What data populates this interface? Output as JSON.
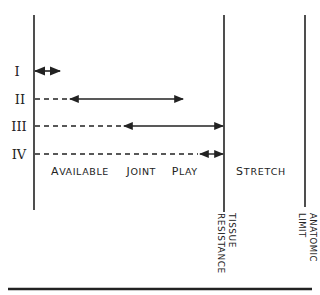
{
  "diagram": {
    "grades": [
      {
        "label": "I",
        "y": 71,
        "dash_end": 34,
        "arrow_start": 34,
        "arrow_end": 60
      },
      {
        "label": "II",
        "y": 99,
        "dash_end": 70,
        "arrow_start": 70,
        "arrow_end": 183
      },
      {
        "label": "III",
        "y": 126,
        "dash_end": 124,
        "arrow_start": 124,
        "arrow_end": 223
      },
      {
        "label": "IV",
        "y": 154,
        "dash_end": 200,
        "arrow_start": 200,
        "arrow_end": 223
      }
    ],
    "zones": {
      "available_joint_play": {
        "first": "A",
        "rest": "VAILABLE",
        "word2_first": "J",
        "word2_rest": "OINT",
        "word3_first": "P",
        "word3_rest": "LAY"
      },
      "stretch": {
        "first": "S",
        "rest": "TRETCH"
      }
    },
    "boundaries": {
      "tissue_resistance": {
        "line1": "TISSUE",
        "line2": "RESISTANCE"
      },
      "anatomic_limit": {
        "line1": "ANATOMIC",
        "line2": "LIMIT"
      }
    },
    "colors": {
      "ink": "#222222",
      "background": "#ffffff"
    }
  }
}
